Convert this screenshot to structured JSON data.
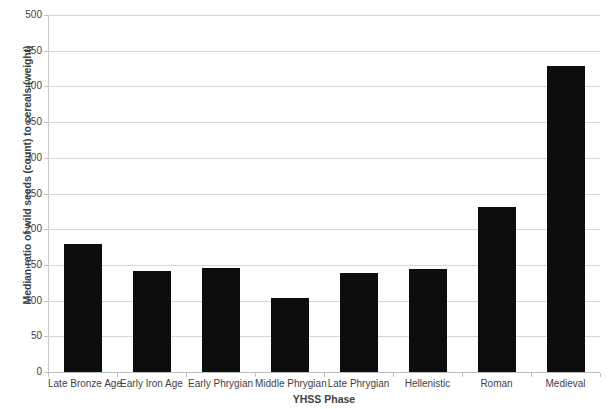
{
  "chart_data": {
    "type": "bar",
    "title": "",
    "xlabel": "YHSS Phase",
    "ylabel": "Median ratio of wild seeds (count) to cereals (weight)",
    "categories": [
      "Late Bronze Age",
      "Early Iron Age",
      "Early Phrygian",
      "Middle Phrygian",
      "Late Phrygian",
      "Hellenistic",
      "Roman",
      "Medieval"
    ],
    "values": [
      179,
      141,
      145,
      104,
      139,
      144,
      231,
      429
    ],
    "ylim": [
      0,
      500
    ],
    "ytick_step": 50,
    "yticks": [
      0,
      50,
      100,
      150,
      200,
      250,
      300,
      350,
      400,
      450,
      500
    ],
    "ytick_labels": [
      "0",
      "50",
      "100",
      "150",
      "200",
      "250",
      "300",
      "350",
      "400",
      "450",
      "500"
    ],
    "grid": true,
    "grid_axis": "y",
    "legend": false,
    "legend_position": "none",
    "bar_color": "#0d0d0d",
    "gridline_color": "#d6d6d6",
    "axis_color": "#bdbdbd",
    "background_color": "#ffffff",
    "text_color": "#3f3f3f"
  }
}
